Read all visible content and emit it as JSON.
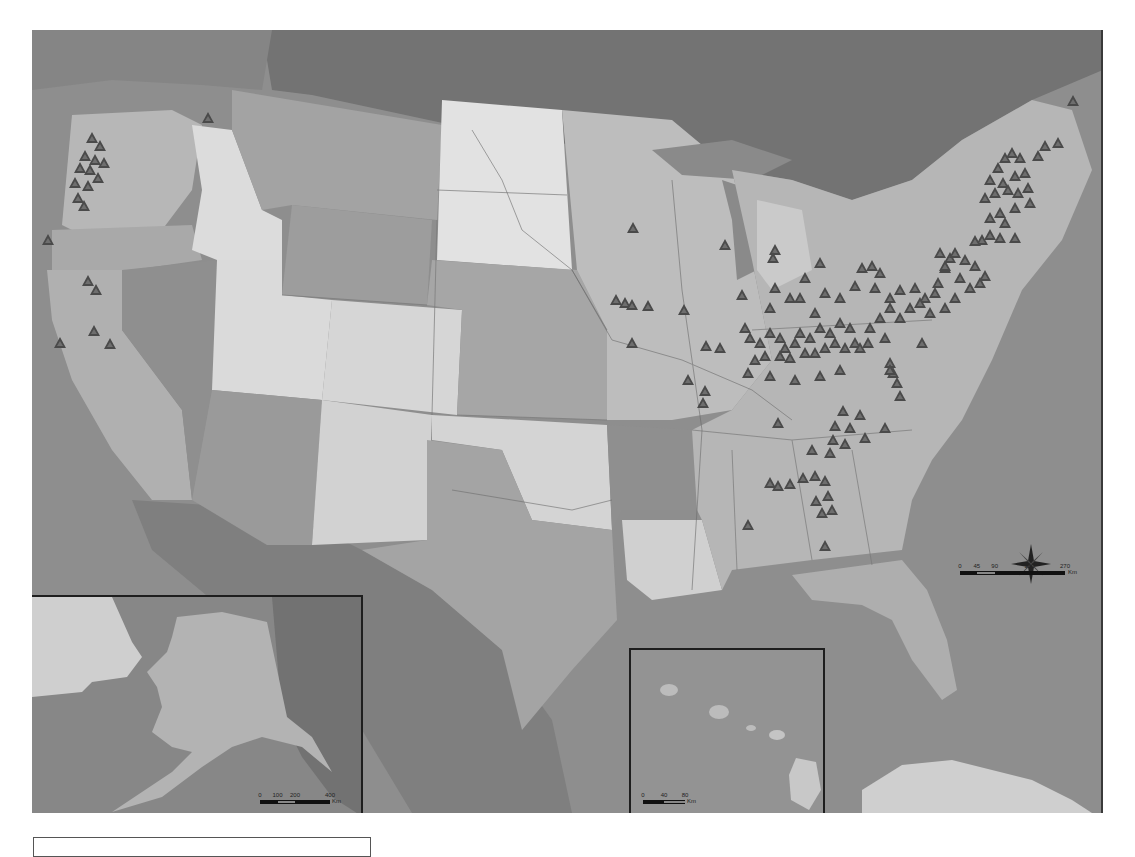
{
  "map": {
    "title": "",
    "colors": {
      "ocean": "#8e8e8e",
      "canada": "#7c7c7c",
      "states_light": "#d8d8d8",
      "states_mid": "#b4b4b4",
      "states_dark": "#9c9c9c",
      "marker_fill": "#4a4a4a",
      "inset_border": "#1e1e1e"
    },
    "marker_symbol": "triangle",
    "markers": [
      [
        208,
        120
      ],
      [
        92,
        140
      ],
      [
        100,
        148
      ],
      [
        85,
        158
      ],
      [
        95,
        162
      ],
      [
        104,
        165
      ],
      [
        80,
        170
      ],
      [
        90,
        172
      ],
      [
        98,
        180
      ],
      [
        75,
        185
      ],
      [
        88,
        188
      ],
      [
        78,
        200
      ],
      [
        84,
        208
      ],
      [
        48,
        242
      ],
      [
        88,
        283
      ],
      [
        96,
        292
      ],
      [
        94,
        333
      ],
      [
        60,
        345
      ],
      [
        110,
        346
      ],
      [
        633,
        230
      ],
      [
        725,
        247
      ],
      [
        775,
        252
      ],
      [
        820,
        265
      ],
      [
        616,
        302
      ],
      [
        625,
        305
      ],
      [
        632,
        307
      ],
      [
        648,
        308
      ],
      [
        684,
        312
      ],
      [
        742,
        297
      ],
      [
        632,
        345
      ],
      [
        706,
        348
      ],
      [
        720,
        350
      ],
      [
        688,
        382
      ],
      [
        705,
        393
      ],
      [
        703,
        405
      ],
      [
        773,
        260
      ],
      [
        775,
        290
      ],
      [
        770,
        310
      ],
      [
        790,
        300
      ],
      [
        805,
        280
      ],
      [
        800,
        300
      ],
      [
        815,
        315
      ],
      [
        825,
        295
      ],
      [
        840,
        300
      ],
      [
        855,
        288
      ],
      [
        862,
        270
      ],
      [
        872,
        268
      ],
      [
        880,
        275
      ],
      [
        875,
        290
      ],
      [
        890,
        300
      ],
      [
        900,
        292
      ],
      [
        915,
        290
      ],
      [
        925,
        300
      ],
      [
        938,
        285
      ],
      [
        945,
        270
      ],
      [
        950,
        260
      ],
      [
        960,
        280
      ],
      [
        970,
        290
      ],
      [
        980,
        285
      ],
      [
        955,
        300
      ],
      [
        945,
        310
      ],
      [
        930,
        315
      ],
      [
        910,
        310
      ],
      [
        745,
        330
      ],
      [
        750,
        340
      ],
      [
        760,
        345
      ],
      [
        770,
        335
      ],
      [
        780,
        340
      ],
      [
        785,
        350
      ],
      [
        795,
        345
      ],
      [
        800,
        335
      ],
      [
        810,
        340
      ],
      [
        820,
        330
      ],
      [
        830,
        335
      ],
      [
        840,
        325
      ],
      [
        850,
        330
      ],
      [
        855,
        345
      ],
      [
        845,
        350
      ],
      [
        835,
        345
      ],
      [
        825,
        350
      ],
      [
        815,
        355
      ],
      [
        805,
        355
      ],
      [
        790,
        360
      ],
      [
        780,
        358
      ],
      [
        765,
        358
      ],
      [
        755,
        362
      ],
      [
        748,
        375
      ],
      [
        770,
        378
      ],
      [
        795,
        382
      ],
      [
        820,
        378
      ],
      [
        840,
        372
      ],
      [
        860,
        350
      ],
      [
        870,
        330
      ],
      [
        880,
        320
      ],
      [
        890,
        310
      ],
      [
        900,
        320
      ],
      [
        885,
        340
      ],
      [
        868,
        345
      ],
      [
        890,
        365
      ],
      [
        893,
        375
      ],
      [
        897,
        385
      ],
      [
        900,
        398
      ],
      [
        890,
        372
      ],
      [
        922,
        345
      ],
      [
        843,
        413
      ],
      [
        860,
        417
      ],
      [
        835,
        428
      ],
      [
        850,
        430
      ],
      [
        885,
        430
      ],
      [
        833,
        442
      ],
      [
        845,
        446
      ],
      [
        865,
        440
      ],
      [
        812,
        452
      ],
      [
        830,
        455
      ],
      [
        770,
        485
      ],
      [
        778,
        488
      ],
      [
        790,
        486
      ],
      [
        803,
        480
      ],
      [
        815,
        478
      ],
      [
        825,
        483
      ],
      [
        828,
        498
      ],
      [
        816,
        503
      ],
      [
        822,
        515
      ],
      [
        832,
        512
      ],
      [
        825,
        548
      ],
      [
        748,
        527
      ],
      [
        778,
        425
      ],
      [
        985,
        200
      ],
      [
        990,
        182
      ],
      [
        998,
        170
      ],
      [
        1005,
        160
      ],
      [
        1012,
        155
      ],
      [
        1020,
        160
      ],
      [
        1025,
        175
      ],
      [
        1015,
        178
      ],
      [
        1003,
        185
      ],
      [
        995,
        195
      ],
      [
        1008,
        192
      ],
      [
        1018,
        195
      ],
      [
        1028,
        190
      ],
      [
        1030,
        205
      ],
      [
        1015,
        210
      ],
      [
        1000,
        215
      ],
      [
        990,
        220
      ],
      [
        1005,
        225
      ],
      [
        990,
        237
      ],
      [
        1000,
        240
      ],
      [
        1015,
        240
      ],
      [
        982,
        242
      ],
      [
        975,
        243
      ],
      [
        1038,
        158
      ],
      [
        1045,
        148
      ],
      [
        1073,
        103
      ],
      [
        1058,
        145
      ],
      [
        940,
        255
      ],
      [
        955,
        255
      ],
      [
        965,
        262
      ],
      [
        975,
        268
      ],
      [
        985,
        278
      ],
      [
        945,
        268
      ],
      [
        935,
        295
      ],
      [
        920,
        305
      ]
    ],
    "north_arrow": {
      "label": "N",
      "icon": "compass-rose-icon"
    },
    "scale_main": {
      "ticks": [
        "0",
        "45",
        "90",
        "180",
        "270"
      ],
      "unit": "Km"
    },
    "insets": {
      "alaska": {
        "name": "Alaska",
        "scale_ticks": [
          "0",
          "100",
          "200",
          "400"
        ],
        "unit": "Km"
      },
      "hawaii": {
        "name": "Hawaii",
        "scale_ticks": [
          "0",
          "40",
          "80"
        ],
        "unit": "Km"
      }
    },
    "legend_box": {
      "text": ""
    }
  }
}
